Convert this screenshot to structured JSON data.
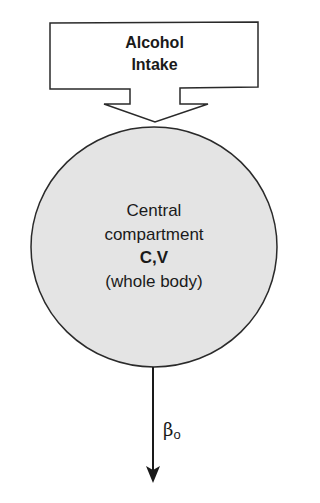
{
  "diagram": {
    "type": "one-compartment pharmacokinetic model",
    "input_box": {
      "label_line1": "Alcohol",
      "label_line2": "Intake"
    },
    "compartment": {
      "line1": "Central",
      "line2": "compartment",
      "line3": "C,V",
      "line4": "(whole body)"
    },
    "elimination": {
      "symbol": "β",
      "subscript": "o"
    },
    "colors": {
      "stroke": "#2a2a2a",
      "compartment_fill": "#e4e4e4",
      "background": "#ffffff"
    }
  }
}
